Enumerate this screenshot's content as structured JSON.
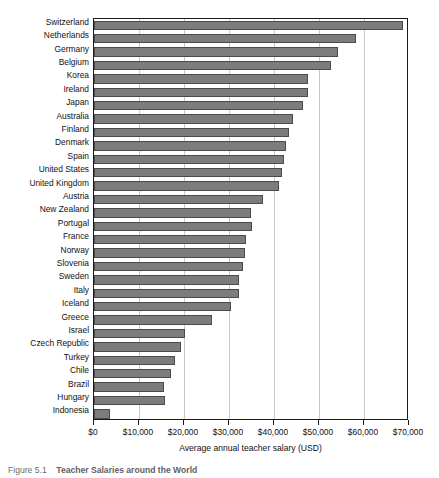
{
  "chart_data": {
    "type": "bar",
    "orientation": "horizontal",
    "title": "",
    "xlabel": "Average annual teacher salary (USD)",
    "ylabel": "",
    "xlim": [
      0,
      70000
    ],
    "grid": true,
    "legend": null,
    "xtick_labels": [
      "$0",
      "$10,000",
      "$20,000",
      "$30,000",
      "$40,000",
      "$50,000",
      "$60,000",
      "$70,000"
    ],
    "xtick_values": [
      0,
      10000,
      20000,
      30000,
      40000,
      50000,
      60000,
      70000
    ],
    "bar_color": "#7c7c7c",
    "bar_edge_color": "#4b4b4b",
    "categories": [
      "Switzerland",
      "Netherlands",
      "Germany",
      "Belgium",
      "Korea",
      "Ireland",
      "Japan",
      "Australia",
      "Finland",
      "Denmark",
      "Spain",
      "United States",
      "United Kingdom",
      "Austria",
      "New Zealand",
      "Portugal",
      "France",
      "Norway",
      "Slovenia",
      "Sweden",
      "Italy",
      "Iceland",
      "Greece",
      "Israel",
      "Czech Republic",
      "Turkey",
      "Chile",
      "Brazil",
      "Hungary",
      "Indonesia"
    ],
    "values": [
      68700,
      58200,
      54200,
      52700,
      47600,
      47600,
      46400,
      44200,
      43300,
      42700,
      42200,
      41800,
      41000,
      37600,
      34900,
      35100,
      33800,
      33600,
      33100,
      32200,
      32200,
      30400,
      26200,
      20200,
      19300,
      18000,
      17100,
      15600,
      15800,
      3600
    ]
  },
  "caption": {
    "number": "Figure 5.1",
    "title": "Teacher Salaries around the World"
  }
}
